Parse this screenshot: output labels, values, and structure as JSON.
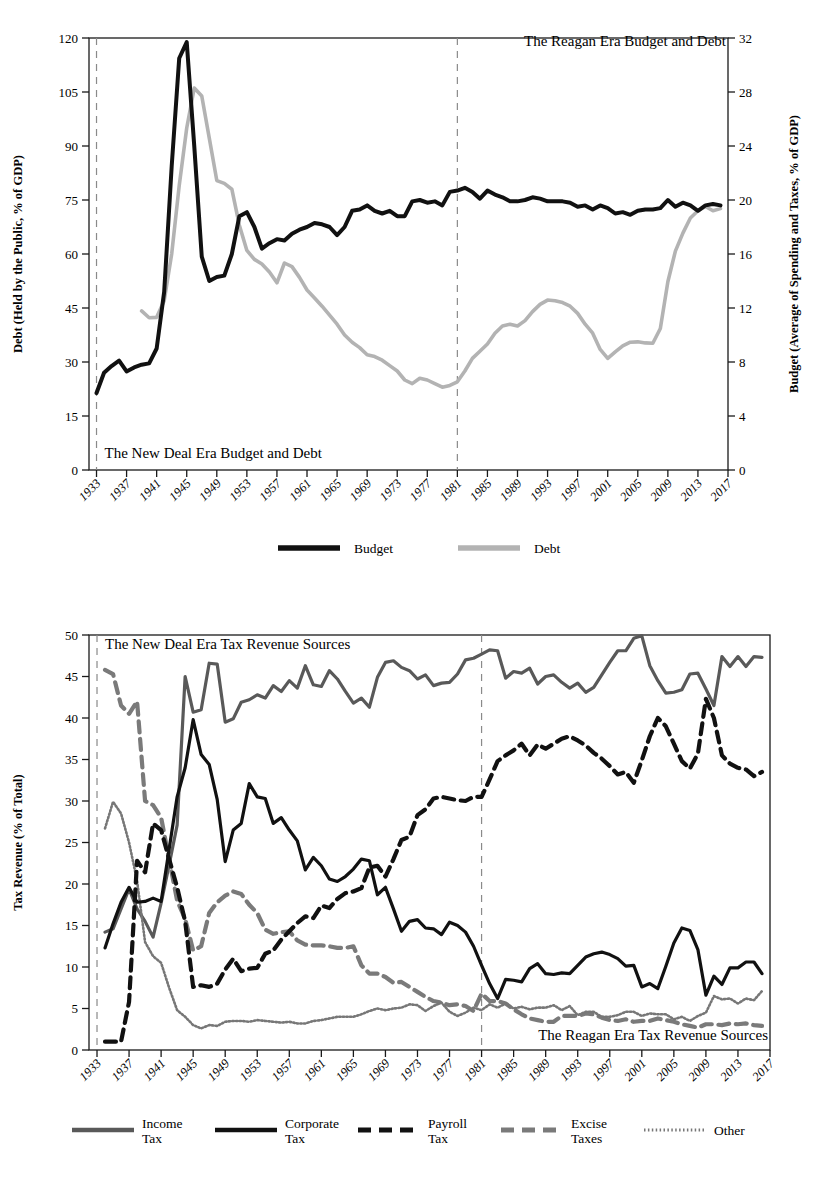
{
  "figures": [
    {
      "id": "budget-debt",
      "annotations": {
        "left_note": "The New Deal Era Budget and Debt",
        "right_note": "The Reagan Era Budget and Debt"
      },
      "legend": [
        {
          "label": "Budget",
          "color": "#111111",
          "dash": "none"
        },
        {
          "label": "Debt",
          "color": "#b3b3b3",
          "dash": "none"
        }
      ]
    },
    {
      "id": "tax-revenue",
      "annotations": {
        "left_note": "The New Deal Era Tax Revenue Sources",
        "right_note": "The Reagan Era Tax Revenue Sources"
      },
      "legend": [
        {
          "label_line1": "Income",
          "label_line2": "Tax",
          "color": "#595959",
          "dash": "none"
        },
        {
          "label_line1": "Corporate",
          "label_line2": "Tax",
          "color": "#111111",
          "dash": "none"
        },
        {
          "label_line1": "Payroll",
          "label_line2": "Tax",
          "color": "#111111",
          "dash": "dash"
        },
        {
          "label_line1": "Excise",
          "label_line2": "Taxes",
          "color": "#7a7a7a",
          "dash": "dash"
        },
        {
          "label_line1": "Other",
          "label_line2": "",
          "color": "#777777",
          "dash": "dot"
        }
      ]
    }
  ],
  "chart_data": [
    {
      "type": "line",
      "title": "",
      "id": "budget-and-debt",
      "xlabel": "",
      "ylabel": "Debt (Held by the Public, % of GDP)",
      "y2label": "Budget (Average of Spending and Taxes, % of GDP)",
      "xlim": [
        1932,
        2017
      ],
      "ylim": [
        0,
        120
      ],
      "y2lim": [
        0,
        32
      ],
      "yticks": [
        0,
        15,
        30,
        45,
        60,
        75,
        90,
        105,
        120
      ],
      "y2ticks": [
        0,
        4,
        8,
        12,
        16,
        20,
        24,
        28,
        32
      ],
      "xticks": [
        1933,
        1937,
        1941,
        1945,
        1949,
        1953,
        1957,
        1961,
        1965,
        1969,
        1973,
        1977,
        1981,
        1985,
        1989,
        1993,
        1997,
        2001,
        2005,
        2009,
        2013,
        2017
      ],
      "grid": false,
      "legend_position": "below",
      "era_lines": [
        1933,
        1981
      ],
      "x": [
        1933,
        1934,
        1935,
        1936,
        1937,
        1938,
        1939,
        1940,
        1941,
        1942,
        1943,
        1944,
        1945,
        1946,
        1947,
        1948,
        1949,
        1950,
        1951,
        1952,
        1953,
        1954,
        1955,
        1956,
        1957,
        1958,
        1959,
        1960,
        1961,
        1962,
        1963,
        1964,
        1965,
        1966,
        1967,
        1968,
        1969,
        1970,
        1971,
        1972,
        1973,
        1974,
        1975,
        1976,
        1977,
        1978,
        1979,
        1980,
        1981,
        1982,
        1983,
        1984,
        1985,
        1986,
        1987,
        1988,
        1989,
        1990,
        1991,
        1992,
        1993,
        1994,
        1995,
        1996,
        1997,
        1998,
        1999,
        2000,
        2001,
        2002,
        2003,
        2004,
        2005,
        2006,
        2007,
        2008,
        2009,
        2010,
        2011,
        2012,
        2013,
        2014,
        2015,
        2016
      ],
      "series": [
        {
          "name": "Debt",
          "axis": "left",
          "color": "#b3b3b3",
          "note": "Debt held by the public, % of GDP; plotted on the left axis. Series drawn starting 1939.",
          "values": [
            null,
            null,
            null,
            null,
            null,
            null,
            44.2,
            42.3,
            42.4,
            47.0,
            60.0,
            79.0,
            95.0,
            106.1,
            103.9,
            92.2,
            80.4,
            79.6,
            78.0,
            68.0,
            61.0,
            58.5,
            57.2,
            55.0,
            52.0,
            57.5,
            56.5,
            53.5,
            50.0,
            47.8,
            45.5,
            43.0,
            40.5,
            37.5,
            35.5,
            34.0,
            32.0,
            31.5,
            30.5,
            29.0,
            27.5,
            25.0,
            24.0,
            25.5,
            25.0,
            24.0,
            23.0,
            23.5,
            24.5,
            27.5,
            31.0,
            33.0,
            35.0,
            38.0,
            40.0,
            40.5,
            40.0,
            41.5,
            44.0,
            46.0,
            47.2,
            47.0,
            46.5,
            45.5,
            43.5,
            40.5,
            38.0,
            33.5,
            31.0,
            32.8,
            34.5,
            35.5,
            35.6,
            35.3,
            35.2,
            39.3,
            52.3,
            60.8,
            65.8,
            70.0,
            72.0,
            73.2,
            72.0,
            72.6
          ]
        },
        {
          "name": "Budget",
          "axis": "right",
          "color": "#111111",
          "note": "Average of federal spending and taxes, % of GDP; plotted on the right axis.",
          "values": [
            5.7,
            7.2,
            7.7,
            8.1,
            7.3,
            7.6,
            7.8,
            7.9,
            9.0,
            13.2,
            22.5,
            30.5,
            31.7,
            24.0,
            15.8,
            14.0,
            14.3,
            14.4,
            16.0,
            18.8,
            19.1,
            18.0,
            16.4,
            16.8,
            17.1,
            17.0,
            17.5,
            17.8,
            18.0,
            18.3,
            18.2,
            18.0,
            17.4,
            18.0,
            19.2,
            19.3,
            19.6,
            19.2,
            19.0,
            19.2,
            18.8,
            18.8,
            19.9,
            20.0,
            19.8,
            19.9,
            19.6,
            20.6,
            20.7,
            20.9,
            20.6,
            20.1,
            20.7,
            20.4,
            20.2,
            19.9,
            19.9,
            20.0,
            20.2,
            20.1,
            19.9,
            19.9,
            19.9,
            19.8,
            19.5,
            19.6,
            19.3,
            19.6,
            19.4,
            19.0,
            19.1,
            18.9,
            19.2,
            19.3,
            19.3,
            19.4,
            20.0,
            19.5,
            19.8,
            19.6,
            19.2,
            19.6,
            19.7,
            19.6
          ]
        }
      ]
    },
    {
      "type": "line",
      "title": "",
      "id": "tax-revenue-sources",
      "xlabel": "",
      "ylabel": "Tax Revenue (% of Total)",
      "xlim": [
        1932,
        2017
      ],
      "ylim": [
        0,
        50
      ],
      "yticks": [
        0,
        5,
        10,
        15,
        20,
        25,
        30,
        35,
        40,
        45,
        50
      ],
      "xticks": [
        1933,
        1937,
        1941,
        1945,
        1949,
        1953,
        1957,
        1961,
        1965,
        1969,
        1973,
        1977,
        1981,
        1985,
        1989,
        1993,
        1997,
        2001,
        2005,
        2009,
        2013,
        2017
      ],
      "grid": false,
      "legend_position": "below",
      "era_lines": [
        1933,
        1981
      ],
      "x": [
        1934,
        1935,
        1936,
        1937,
        1938,
        1939,
        1940,
        1941,
        1942,
        1943,
        1944,
        1945,
        1946,
        1947,
        1948,
        1949,
        1950,
        1951,
        1952,
        1953,
        1954,
        1955,
        1956,
        1957,
        1958,
        1959,
        1960,
        1961,
        1962,
        1963,
        1964,
        1965,
        1966,
        1967,
        1968,
        1969,
        1970,
        1971,
        1972,
        1973,
        1974,
        1975,
        1976,
        1977,
        1978,
        1979,
        1980,
        1981,
        1982,
        1983,
        1984,
        1985,
        1986,
        1987,
        1988,
        1989,
        1990,
        1991,
        1992,
        1993,
        1994,
        1995,
        1996,
        1997,
        1998,
        1999,
        2000,
        2001,
        2002,
        2003,
        2004,
        2005,
        2006,
        2007,
        2008,
        2009,
        2010,
        2011,
        2012,
        2013,
        2014,
        2015,
        2016
      ],
      "series": [
        {
          "name": "Income Tax",
          "color": "#595959",
          "dash": "none",
          "values": [
            14.2,
            14.6,
            17.0,
            19.4,
            17.0,
            15.5,
            13.6,
            17.7,
            22.3,
            27.1,
            45.0,
            40.7,
            41.0,
            46.6,
            46.5,
            39.5,
            39.9,
            41.9,
            42.2,
            42.8,
            42.4,
            43.9,
            43.2,
            44.5,
            43.6,
            46.3,
            44.0,
            43.8,
            45.7,
            44.7,
            43.2,
            41.8,
            42.4,
            41.3,
            44.9,
            46.7,
            46.9,
            46.1,
            45.7,
            44.7,
            45.2,
            43.9,
            44.2,
            44.3,
            45.3,
            47.0,
            47.2,
            47.7,
            48.2,
            48.1,
            44.8,
            45.6,
            45.4,
            46.0,
            44.1,
            45.0,
            45.2,
            44.3,
            43.6,
            44.2,
            43.1,
            43.7,
            45.2,
            46.7,
            48.1,
            48.1,
            49.6,
            49.9,
            46.3,
            44.5,
            43.0,
            43.1,
            43.4,
            45.3,
            45.4,
            43.5,
            41.5,
            47.4,
            46.2,
            47.4,
            46.2,
            47.4,
            47.3
          ]
        },
        {
          "name": "Corporate Tax",
          "color": "#111111",
          "dash": "none",
          "values": [
            12.3,
            15.2,
            17.8,
            19.6,
            17.8,
            17.9,
            18.3,
            17.9,
            24.2,
            30.5,
            34.0,
            39.8,
            35.6,
            34.4,
            30.2,
            22.7,
            26.5,
            27.3,
            32.1,
            30.5,
            30.3,
            27.3,
            28.0,
            26.5,
            25.2,
            21.7,
            23.2,
            22.2,
            20.6,
            20.3,
            20.9,
            21.8,
            23.0,
            22.8,
            18.7,
            19.6,
            17.0,
            14.3,
            15.5,
            15.7,
            14.7,
            14.6,
            13.9,
            15.4,
            15.0,
            14.2,
            12.5,
            10.2,
            8.0,
            6.2,
            8.5,
            8.4,
            8.2,
            9.8,
            10.4,
            9.2,
            9.1,
            9.3,
            9.2,
            10.2,
            11.2,
            11.6,
            11.8,
            11.5,
            11.0,
            10.1,
            10.2,
            7.6,
            8.0,
            7.4,
            10.1,
            12.9,
            14.7,
            14.4,
            12.1,
            6.6,
            8.9,
            7.9,
            9.9,
            9.9,
            10.6,
            10.6,
            9.2
          ]
        },
        {
          "name": "Payroll Tax",
          "color": "#111111",
          "dash": "dash",
          "values": [
            1.0,
            1.0,
            1.0,
            5.8,
            22.8,
            21.4,
            27.3,
            26.5,
            23.0,
            19.6,
            15.5,
            7.6,
            7.8,
            7.6,
            8.0,
            9.7,
            11.0,
            9.5,
            9.8,
            9.9,
            11.6,
            12.0,
            13.3,
            14.3,
            15.3,
            16.1,
            15.9,
            17.4,
            17.1,
            18.2,
            18.9,
            19.1,
            19.5,
            22.0,
            22.2,
            20.9,
            23.0,
            25.3,
            25.7,
            28.3,
            29.0,
            30.3,
            30.5,
            30.3,
            30.1,
            30.0,
            30.5,
            30.5,
            32.6,
            34.8,
            35.5,
            36.1,
            36.9,
            35.5,
            36.8,
            36.3,
            36.9,
            37.5,
            37.8,
            37.3,
            36.7,
            35.8,
            35.1,
            34.2,
            33.2,
            33.5,
            32.2,
            34.9,
            37.8,
            40.0,
            39.0,
            36.9,
            34.8,
            33.9,
            35.7,
            42.3,
            40.0,
            35.5,
            34.5,
            34.0,
            33.8,
            33.0,
            33.5
          ]
        },
        {
          "name": "Excise Taxes",
          "color": "#7a7a7a",
          "dash": "dash",
          "values": [
            45.8,
            45.3,
            41.5,
            40.5,
            42.0,
            30.0,
            29.5,
            28.0,
            23.0,
            18.0,
            15.8,
            12.0,
            12.5,
            16.5,
            17.8,
            18.6,
            19.1,
            18.8,
            17.5,
            16.5,
            14.5,
            14.0,
            14.2,
            14.3,
            13.2,
            12.7,
            12.6,
            12.6,
            12.5,
            12.3,
            12.3,
            12.5,
            10.2,
            9.2,
            9.2,
            8.8,
            8.1,
            8.2,
            7.6,
            7.0,
            6.4,
            5.9,
            5.7,
            5.4,
            5.5,
            5.3,
            4.7,
            6.8,
            5.9,
            5.9,
            5.6,
            4.9,
            4.3,
            3.8,
            3.6,
            3.4,
            3.4,
            4.1,
            4.1,
            4.1,
            4.4,
            4.3,
            3.9,
            3.6,
            3.5,
            3.7,
            3.4,
            3.5,
            3.5,
            3.8,
            3.6,
            3.4,
            3.1,
            2.9,
            2.7,
            3.1,
            3.1,
            3.0,
            3.2,
            3.1,
            3.2,
            3.0,
            2.9
          ]
        },
        {
          "name": "Other",
          "color": "#777777",
          "dash": "dot",
          "values": [
            26.7,
            29.9,
            28.5,
            25.0,
            20.4,
            13.0,
            11.3,
            10.5,
            7.5,
            4.8,
            4.0,
            3.0,
            2.6,
            3.0,
            2.9,
            3.4,
            3.5,
            3.5,
            3.4,
            3.6,
            3.5,
            3.4,
            3.3,
            3.4,
            3.2,
            3.2,
            3.5,
            3.6,
            3.8,
            4.0,
            4.0,
            4.0,
            4.3,
            4.7,
            5.0,
            4.8,
            5.0,
            5.1,
            5.5,
            5.4,
            4.7,
            5.3,
            5.7,
            4.6,
            4.1,
            4.5,
            5.1,
            4.8,
            5.5,
            5.1,
            5.6,
            5.0,
            5.2,
            4.9,
            5.1,
            5.1,
            5.4,
            4.8,
            5.3,
            4.2,
            4.6,
            4.6,
            4.0,
            4.0,
            4.2,
            4.6,
            4.6,
            4.1,
            4.4,
            4.3,
            4.3,
            3.7,
            4.0,
            3.5,
            4.1,
            4.5,
            6.5,
            6.1,
            6.2,
            5.6,
            6.2,
            6.0,
            7.1
          ]
        }
      ]
    }
  ]
}
